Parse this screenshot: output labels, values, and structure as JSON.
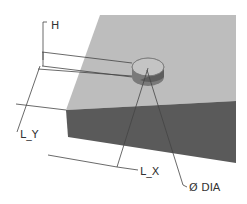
{
  "diagram": {
    "labels": {
      "height": "H",
      "length_y": "L_Y",
      "length_x": "L_X",
      "diameter": "Ø DIA"
    },
    "colors": {
      "background": "#ffffff",
      "plate_top": "#bdbdbd",
      "plate_side": "#5a5a5a",
      "boss_top": "#c4c4c4",
      "boss_side_light": "#8a8a8a",
      "boss_side_dark": "#4a4a4a",
      "dimension_line": "#444444",
      "text": "#333333"
    }
  }
}
